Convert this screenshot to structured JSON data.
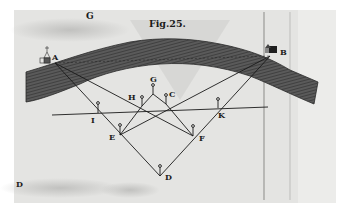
{
  "figure": {
    "title": "Fig.25.",
    "colors": {
      "paper": "#e4e4e2",
      "band": "#4a4a4a",
      "ink": "#1a1a1a",
      "border": "#ffffff"
    }
  },
  "labels": {
    "corner_top": "G",
    "A": "A",
    "B": "B",
    "G": "G",
    "H": "H",
    "C": "C",
    "I": "I",
    "K": "K",
    "E": "E",
    "F": "F",
    "D": "D",
    "corner_bottom": "D"
  },
  "landmarks": {
    "A": "church-icon",
    "B": "house-icon"
  },
  "stations": [
    {
      "name": "G",
      "x": 153,
      "y": 88
    },
    {
      "name": "H",
      "x": 142,
      "y": 106
    },
    {
      "name": "C",
      "x": 166,
      "y": 104
    },
    {
      "name": "I",
      "x": 98,
      "y": 113
    },
    {
      "name": "K",
      "x": 218,
      "y": 108
    },
    {
      "name": "E",
      "x": 120,
      "y": 135
    },
    {
      "name": "F",
      "x": 193,
      "y": 136
    },
    {
      "name": "D",
      "x": 160,
      "y": 176
    }
  ]
}
